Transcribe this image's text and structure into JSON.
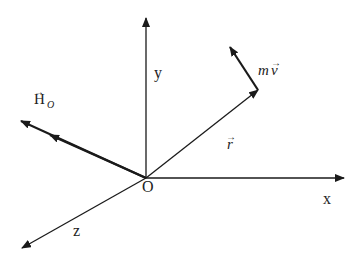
{
  "diagram": {
    "origin_label": "O",
    "axes": {
      "x": "x",
      "y": "y",
      "z": "z"
    },
    "vectors": {
      "position": {
        "label": "r",
        "arrow": "→"
      },
      "momentum": {
        "label_m": "m",
        "label_v": "v",
        "arrow": "→"
      },
      "angular_momentum": {
        "label": "H",
        "subscript": "O",
        "arrow": "→"
      }
    },
    "colors": {
      "line": "#1a1a1a",
      "text": "#222222"
    }
  }
}
